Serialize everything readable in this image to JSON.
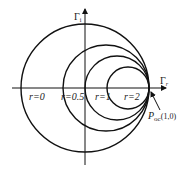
{
  "diagram": {
    "type": "smith-chart-constant-resistance-circles",
    "axes": {
      "real": {
        "label": "Γ",
        "subscript": "r"
      },
      "imag": {
        "label": "Γ",
        "subscript": "i"
      }
    },
    "circles": [
      {
        "r_label": "r=0",
        "r": 0
      },
      {
        "r_label": "r=0.5",
        "r": 0.5
      },
      {
        "r_label": "r=1",
        "r": 1
      },
      {
        "r_label": "r=2",
        "r": 2
      }
    ],
    "point": {
      "label": "P",
      "subscript": "oc",
      "coords": "(1,0)"
    },
    "colors": {
      "stroke": "#111111",
      "background": "#ffffff"
    }
  }
}
